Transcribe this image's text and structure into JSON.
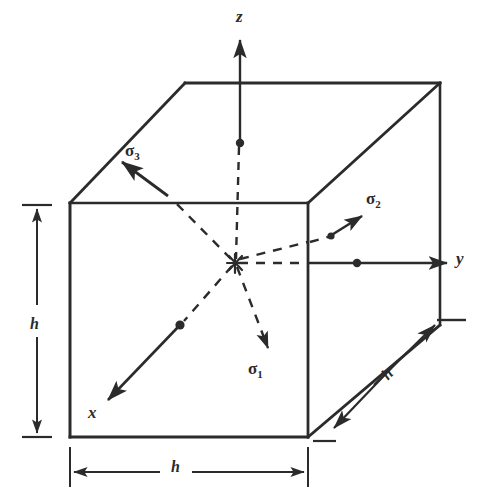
{
  "figure": {
    "kind": "engineering-diagram",
    "ink_color": "#2b2b2b",
    "background_color": "#ffffff"
  },
  "axes": [
    {
      "id": "z",
      "label": "z",
      "label_x": 236,
      "label_y": 8,
      "direction": "up"
    },
    {
      "id": "y",
      "label": "y",
      "label_x": 456,
      "label_y": 250,
      "direction": "right"
    },
    {
      "id": "x",
      "label": "x",
      "label_x": 88,
      "label_y": 404,
      "direction": "down-left"
    }
  ],
  "stresses": [
    {
      "id": "sigma3",
      "symbol": "σ",
      "subscript": "3",
      "label_x": 125,
      "label_y": 142,
      "direction": "up-left"
    },
    {
      "id": "sigma2",
      "symbol": "σ",
      "subscript": "2",
      "label_x": 366,
      "label_y": 190,
      "direction": "up-right"
    },
    {
      "id": "sigma1",
      "symbol": "σ",
      "subscript": "1",
      "label_x": 248,
      "label_y": 360,
      "direction": "down-right"
    }
  ],
  "dimensions": [
    {
      "id": "height",
      "label": "h",
      "label_x": 30,
      "label_y": 316,
      "orientation": "vertical"
    },
    {
      "id": "width",
      "label": "h",
      "label_x": 171,
      "label_y": 459,
      "orientation": "horizontal"
    },
    {
      "id": "depth",
      "label": "h",
      "label_x": 383,
      "label_y": 366,
      "orientation": "diagonal"
    }
  ],
  "geometry": {
    "cube": {
      "front_top_left": [
        70,
        203
      ],
      "front_top_right": [
        308,
        203
      ],
      "front_bottom_left": [
        70,
        437
      ],
      "front_bottom_right": [
        308,
        437
      ],
      "back_top_left": [
        185,
        83
      ],
      "back_top_right": [
        440,
        83
      ],
      "back_bottom_right": [
        440,
        325
      ],
      "center": [
        235,
        263
      ]
    }
  }
}
